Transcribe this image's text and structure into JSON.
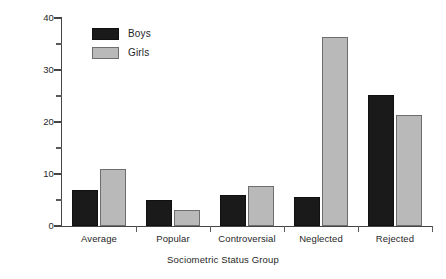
{
  "chart_data": {
    "type": "bar",
    "title": "",
    "xlabel": "Sociometric Status Group",
    "ylabel": "Percent",
    "categories": [
      "Average",
      "Popular",
      "Controversial",
      "Neglected",
      "Rejected"
    ],
    "series": [
      {
        "name": "Boys",
        "color": "#1a1a1a",
        "values": [
          7.0,
          5.0,
          6.0,
          5.5,
          25.2
        ]
      },
      {
        "name": "Girls",
        "color": "#b9b9b9",
        "values": [
          11.0,
          3.0,
          7.7,
          36.4,
          21.4
        ]
      }
    ],
    "ylim": [
      0,
      40
    ],
    "yticks": [
      0,
      10,
      20,
      30,
      40
    ],
    "ytick_labels": [
      "0",
      "10",
      "20",
      "30",
      "40"
    ],
    "yminor_ticks": [
      5,
      15,
      25,
      35
    ],
    "grid": false,
    "legend_position": "top-left-inside"
  },
  "legend": {
    "entries": [
      {
        "label": "Boys"
      },
      {
        "label": "Girls"
      }
    ]
  },
  "axes": {
    "y_title": "Percent",
    "x_title": "Sociometric Status Group"
  }
}
